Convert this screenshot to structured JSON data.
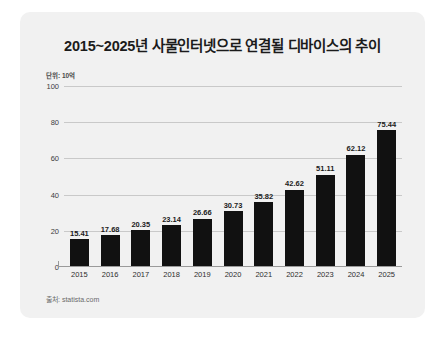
{
  "card": {
    "title": "2015~2025년 사물인터넷으로 연결될 디바이스의 추이",
    "unit": "단위: 10억",
    "source": "출처: statista.com"
  },
  "chart_data": {
    "type": "bar",
    "title": "2015~2025년 사물인터넷으로 연결될 디바이스의 추이",
    "subtitle": "단위: 10억",
    "source": "출처: statista.com",
    "xlabel": "",
    "ylabel": "",
    "ylim": [
      0,
      100
    ],
    "yticks": [
      0,
      20,
      40,
      60,
      80,
      100
    ],
    "ytick_labels": [
      "0",
      "20",
      "40",
      "60",
      "80",
      "100"
    ],
    "grid": "horizontal",
    "legend": "none",
    "bar_color": "#111111",
    "categories": [
      "2015",
      "2016",
      "2017",
      "2018",
      "2019",
      "2020",
      "2021",
      "2022",
      "2023",
      "2024",
      "2025"
    ],
    "values": [
      15.41,
      17.68,
      20.35,
      23.14,
      26.66,
      30.73,
      35.82,
      42.62,
      51.11,
      62.12,
      75.44
    ],
    "value_labels": [
      "15.41",
      "17.68",
      "20.35",
      "23.14",
      "26.66",
      "30.73",
      "35.82",
      "42.62",
      "51.11",
      "62.12",
      "75.44"
    ]
  }
}
